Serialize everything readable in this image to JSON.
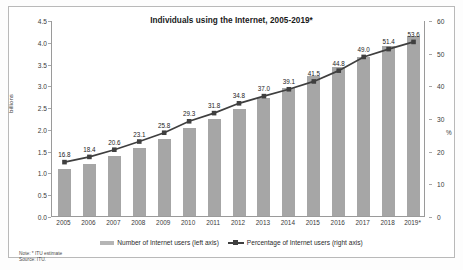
{
  "chart_data": {
    "type": "bar",
    "title": "Individuals using the Internet, 2005-2019*",
    "categories": [
      "2005",
      "2006",
      "2007",
      "2008",
      "2009",
      "2010",
      "2011",
      "2012",
      "2013",
      "2014",
      "2015",
      "2016",
      "2017",
      "2018",
      "2019*"
    ],
    "series": [
      {
        "name": "Number of Internet users (left axis)",
        "type": "bar",
        "axis": "left",
        "unit": "billions",
        "values": [
          1.08,
          1.19,
          1.37,
          1.56,
          1.76,
          2.02,
          2.23,
          2.45,
          2.7,
          2.93,
          3.21,
          3.42,
          3.66,
          3.9,
          4.13
        ]
      },
      {
        "name": "Percentage of Internet users (right axis)",
        "type": "line",
        "axis": "right",
        "unit": "%",
        "values": [
          16.8,
          18.4,
          20.6,
          23.1,
          25.8,
          29.3,
          31.8,
          34.8,
          37.0,
          39.1,
          41.5,
          44.8,
          49.0,
          51.4,
          53.6
        ],
        "data_labels": [
          "16.8",
          "18.4",
          "20.6",
          "23.1",
          "25.8",
          "29.3",
          "31.8",
          "34.8",
          "37.0",
          "39.1",
          "41.5",
          "44.8",
          "49.0",
          "51.4",
          "53.6"
        ]
      }
    ],
    "xlabel": "",
    "ylabel_left": "billions",
    "ylabel_right": "%",
    "ylim_left": [
      0.0,
      4.5
    ],
    "ylim_right": [
      0,
      60
    ],
    "yticks_left": [
      "0.0",
      "0.5",
      "1.0",
      "1.5",
      "2.0",
      "2.5",
      "3.0",
      "3.5",
      "4.0",
      "4.5"
    ],
    "yticks_right": [
      "0",
      "10",
      "20",
      "30",
      "40",
      "50",
      "60"
    ],
    "grid": false,
    "legend_position": "bottom",
    "colors": {
      "bar": "#a6a6a6",
      "line": "#3f3f3f",
      "text": "#222222",
      "axis": "#9a9a9a",
      "background": "#ffffff"
    }
  },
  "legend": {
    "items": [
      {
        "label": "Number of Internet users (left axis)",
        "marker": "bar-swatch"
      },
      {
        "label": "Percentage of Internet users (right axis)",
        "marker": "line-marker-swatch"
      }
    ]
  },
  "footnote": {
    "note": "Note: * ITU estimate",
    "source": "Source: ITU."
  }
}
